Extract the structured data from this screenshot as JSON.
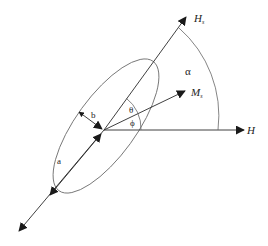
{
  "diagram": {
    "title": "",
    "labels": {
      "hs_main": "H",
      "hs_sub": "s",
      "ms_main": "M",
      "ms_sub": "s",
      "h": "H",
      "alpha": "α",
      "theta": "θ",
      "phi": "ϕ",
      "a": "a",
      "b": "b"
    },
    "colors": {
      "line": "#2a2a2a",
      "ellipse": "#777777",
      "arc": "#666666"
    }
  }
}
